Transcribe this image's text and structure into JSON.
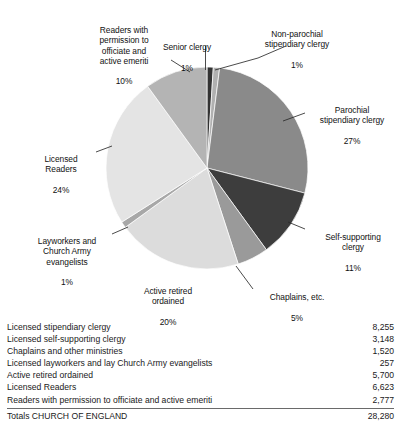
{
  "chart_data": {
    "type": "pie",
    "title": "",
    "legend_position": "callout-labels",
    "grid": false,
    "units": "percent",
    "total_label": "Totals CHURCH OF ENGLAND",
    "total_value": "28,280",
    "categories": [
      "Senior clergy",
      "Non-parochial stipendiary clergy",
      "Parochial stipendiary clergy",
      "Self-supporting clergy",
      "Chaplains, etc.",
      "Active retired ordained",
      "Layworkers and Church Army evangelists",
      "Licensed Readers",
      "Readers with permission to officiate and active emeriti"
    ],
    "values": [
      1,
      1,
      27,
      11,
      5,
      20,
      1,
      24,
      10
    ],
    "colors": [
      "#333333",
      "#b0b0b0",
      "#8a8a8a",
      "#3d3d3d",
      "#9a9a9a",
      "#dcdcdc",
      "#a8a8a8",
      "#e4e4e4",
      "#b4b4b4"
    ],
    "slices": [
      {
        "name": "senior-clergy",
        "label": "Senior clergy",
        "pct_label": "1%",
        "value": 1,
        "color": "#333333"
      },
      {
        "name": "non-parochial",
        "label": "Non-parochial\nstipendiary clergy",
        "pct_label": "1%",
        "value": 1,
        "color": "#b0b0b0"
      },
      {
        "name": "parochial",
        "label": "Parochial\nstipendiary clergy",
        "pct_label": "27%",
        "value": 27,
        "color": "#8a8a8a"
      },
      {
        "name": "self-supporting",
        "label": "Self-supporting\nclergy",
        "pct_label": "11%",
        "value": 11,
        "color": "#3d3d3d"
      },
      {
        "name": "chaplains",
        "label": "Chaplains, etc.",
        "pct_label": "5%",
        "value": 5,
        "color": "#9a9a9a"
      },
      {
        "name": "active-retired",
        "label": "Active retired\nordained",
        "pct_label": "20%",
        "value": 20,
        "color": "#dcdcdc"
      },
      {
        "name": "layworkers",
        "label": "Layworkers and\nChurch Army\nevangelists",
        "pct_label": "1%",
        "value": 1,
        "color": "#a8a8a8"
      },
      {
        "name": "licensed-readers",
        "label": "Licensed\nReaders",
        "pct_label": "24%",
        "value": 24,
        "color": "#e4e4e4"
      },
      {
        "name": "readers-permission",
        "label": "Readers with\npermission to\nofficiate and\nactive emeriti",
        "pct_label": "10%",
        "value": 10,
        "color": "#b4b4b4"
      }
    ]
  },
  "labels": {
    "senior_clergy": {
      "text": "Senior clergy",
      "pct": "1%"
    },
    "non_parochial": {
      "text": "Non-parochial\nstipendiary clergy",
      "pct": "1%"
    },
    "parochial": {
      "text": "Parochial\nstipendiary clergy",
      "pct": "27%"
    },
    "self_supporting": {
      "text": "Self-supporting\nclergy",
      "pct": "11%"
    },
    "chaplains": {
      "text": "Chaplains, etc.",
      "pct": "5%"
    },
    "active_retired": {
      "text": "Active retired\nordained",
      "pct": "20%"
    },
    "layworkers": {
      "text": "Layworkers and\nChurch Army\nevangelists",
      "pct": "1%"
    },
    "licensed_readers": {
      "text": "Licensed\nReaders",
      "pct": "24%"
    },
    "readers_permission": {
      "text": "Readers with\npermission to\nofficiate and\nactive emeriti",
      "pct": "10%"
    }
  },
  "table": {
    "rows": [
      {
        "label": "Licensed stipendiary clergy",
        "value": "8,255"
      },
      {
        "label": "Licensed self-supporting clergy",
        "value": "3,148"
      },
      {
        "label": "Chaplains and other ministries",
        "value": "1,520"
      },
      {
        "label": "Licensed layworkers and lay Church Army evangelists",
        "value": "257"
      },
      {
        "label": "Active retired ordained",
        "value": "5,700"
      },
      {
        "label": "Licensed Readers",
        "value": "6,623"
      },
      {
        "label": "Readers with permission to officiate and active emeriti",
        "value": "2,777"
      }
    ],
    "total": {
      "label": "Totals CHURCH OF ENGLAND",
      "value": "28,280"
    }
  }
}
